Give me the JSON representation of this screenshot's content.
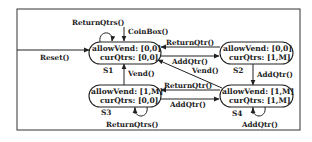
{
  "diagram": {
    "type": "state-machine",
    "initial_transition": {
      "label": "Reset()",
      "target": "S1"
    },
    "states": [
      {
        "id": "S1",
        "name": "S1",
        "line1": "allowVend: [0,0]",
        "line2": "curQtrs: [0,0]"
      },
      {
        "id": "S2",
        "name": "S2",
        "line1": "allowVend: [0,0]",
        "line2": "curQtrs: [1,M]"
      },
      {
        "id": "S3",
        "name": "S3",
        "line1": "allowVend: [1,M]",
        "line2": "curQtrs: [0,0]"
      },
      {
        "id": "S4",
        "name": "S4",
        "line1": "allowVend: [1,M]",
        "line2": "curQtrs: [1,M]"
      }
    ],
    "transitions": [
      {
        "from": "S1",
        "to": "S1",
        "label": "ReturnQtrs()"
      },
      {
        "from": "S1",
        "to": "S1",
        "label": "CoinBox()"
      },
      {
        "from": "S2",
        "to": "S1",
        "label": "ReturnQtr()"
      },
      {
        "from": "S1",
        "to": "S2",
        "label": "AddQtr()"
      },
      {
        "from": "S2",
        "to": "S4",
        "label": "AddQtr()"
      },
      {
        "from": "S4",
        "to": "S1",
        "label": "Vend()"
      },
      {
        "from": "S3",
        "to": "S1",
        "label": "Vend()"
      },
      {
        "from": "S4",
        "to": "S3",
        "label": "ReturnQtr()"
      },
      {
        "from": "S3",
        "to": "S4",
        "label": "AddQtr()"
      },
      {
        "from": "S3",
        "to": "S3",
        "label": "ReturnQtrs()"
      },
      {
        "from": "S4",
        "to": "S4",
        "label": "AddQtr()"
      }
    ]
  }
}
